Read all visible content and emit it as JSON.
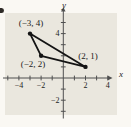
{
  "figure": {
    "outer_background": "#faf8f3",
    "panel_background": "#eae7de",
    "axis_color": "#4f4f4f",
    "shape_color": "#141414",
    "text_color": "#1c1c1c",
    "corner_mark_color": "#2e2a26"
  },
  "chart_data": {
    "type": "scatter",
    "shape": "triangle",
    "title": "",
    "xlabel": "x",
    "ylabel": "y",
    "xlim": [
      -5.4,
      4.3
    ],
    "ylim": [
      -3.6,
      6.3
    ],
    "grid": false,
    "points": [
      {
        "x": -3,
        "y": 4,
        "label": "(−3, 4)"
      },
      {
        "x": -2,
        "y": 2,
        "label": "(−2, 2)"
      },
      {
        "x": 2,
        "y": 1,
        "label": "(2, 1)"
      }
    ],
    "x_ticks": [
      -5,
      -4,
      -3,
      -2,
      -1,
      1,
      2,
      3,
      4
    ],
    "y_ticks": [
      5,
      4,
      3,
      2,
      1,
      -1,
      -2,
      -3
    ],
    "x_tick_labels": [
      {
        "value": -4,
        "label": "−4"
      },
      {
        "value": -2,
        "label": "−2"
      },
      {
        "value": 2,
        "label": "2"
      },
      {
        "value": 4,
        "label": "4"
      }
    ],
    "y_tick_labels": [
      {
        "value": 4,
        "label": "4"
      },
      {
        "value": -2,
        "label": "−2"
      }
    ]
  }
}
